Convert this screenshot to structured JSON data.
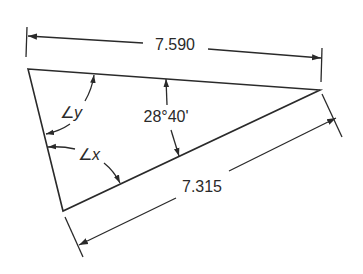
{
  "diagram": {
    "type": "triangle-dimensioned",
    "colors": {
      "line": "#2a2a2a",
      "text": "#2a2a2a",
      "background": "#ffffff"
    },
    "vertices": {
      "top_left": [
        28,
        69
      ],
      "right": [
        320,
        90
      ],
      "bottom": [
        63,
        211
      ]
    },
    "dimensions": {
      "top": {
        "label": "7.590",
        "position": [
          175,
          45
        ]
      },
      "bottom_right": {
        "label": "7.315",
        "position": [
          201,
          187
        ]
      }
    },
    "angles": {
      "right_angle_value": {
        "label": "28°40'",
        "position": [
          166,
          117
        ]
      },
      "angle_y": {
        "symbol": "∠",
        "variable": "y",
        "position": [
          70,
          113
        ]
      },
      "angle_x": {
        "symbol": "∠",
        "variable": "x",
        "position": [
          88,
          155
        ]
      }
    }
  }
}
